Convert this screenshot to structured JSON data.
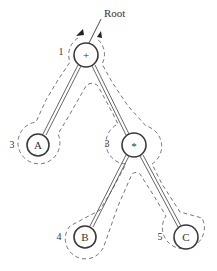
{
  "root_label": "Root",
  "nodes": [
    {
      "id": "plus",
      "label": "+",
      "order": "1",
      "cx": 86,
      "cy": 55,
      "r": 12
    },
    {
      "id": "A",
      "label": "A",
      "order": "2",
      "cx": 38,
      "cy": 145,
      "r": 11
    },
    {
      "id": "times",
      "label": "*",
      "order": "3",
      "cx": 134,
      "cy": 145,
      "r": 12
    },
    {
      "id": "B",
      "label": "B",
      "order": "4",
      "cx": 85,
      "cy": 237,
      "r": 11
    },
    {
      "id": "C",
      "label": "C",
      "order": "5",
      "cx": 186,
      "cy": 237,
      "r": 12
    }
  ],
  "edges": [
    {
      "from": "plus",
      "to": "A"
    },
    {
      "from": "plus",
      "to": "times"
    },
    {
      "from": "times",
      "to": "B"
    },
    {
      "from": "times",
      "to": "C"
    }
  ],
  "colors": {
    "stroke": "#3a3a3a",
    "background": "#ffffff"
  }
}
